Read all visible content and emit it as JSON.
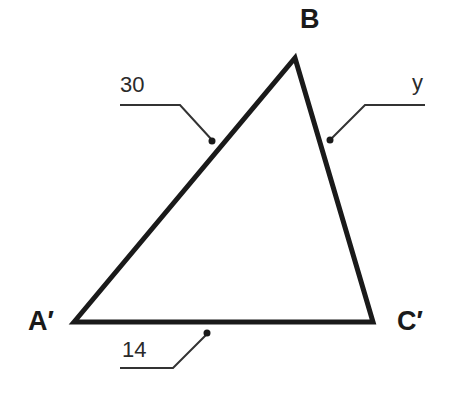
{
  "figure": {
    "type": "triangle",
    "vertices": [
      {
        "id": "A",
        "label": "A′",
        "x": 74,
        "y": 322
      },
      {
        "id": "B",
        "label": "B",
        "x": 295,
        "y": 58
      },
      {
        "id": "C",
        "label": "C′",
        "x": 373,
        "y": 322
      }
    ],
    "sides": [
      {
        "between": "A′B",
        "label": "30"
      },
      {
        "between": "BC′",
        "label": "y"
      },
      {
        "between": "A′C′",
        "label": "14"
      }
    ],
    "stroke_color": "#1a1a1a"
  }
}
